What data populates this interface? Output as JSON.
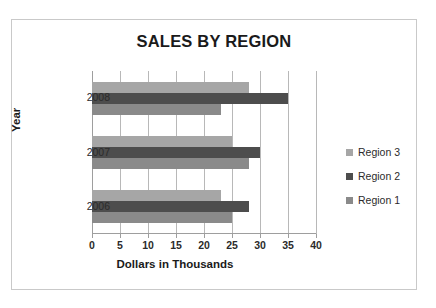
{
  "chart_data": {
    "type": "bar",
    "orientation": "horizontal",
    "title": "SALES BY REGION",
    "xlabel": "Dollars in Thousands",
    "ylabel": "Year",
    "categories": [
      "2008",
      "2007",
      "2006"
    ],
    "series": [
      {
        "name": "Region 1",
        "color": "#8a8a8a",
        "values": [
          23,
          28,
          25
        ]
      },
      {
        "name": "Region 2",
        "color": "#4d4d4d",
        "values": [
          35,
          30,
          28
        ]
      },
      {
        "name": "Region 3",
        "color": "#a6a6a6",
        "values": [
          28,
          25,
          23
        ]
      }
    ],
    "xlim": [
      0,
      40
    ],
    "xticks": [
      "0",
      "5",
      "10",
      "15",
      "20",
      "25",
      "30",
      "35",
      "40"
    ],
    "xtick_values": [
      0,
      5,
      10,
      15,
      20,
      25,
      30,
      35,
      40
    ],
    "grid": true,
    "legend_position": "right",
    "legend_order": [
      "Region 3",
      "Region 2",
      "Region 1"
    ]
  }
}
